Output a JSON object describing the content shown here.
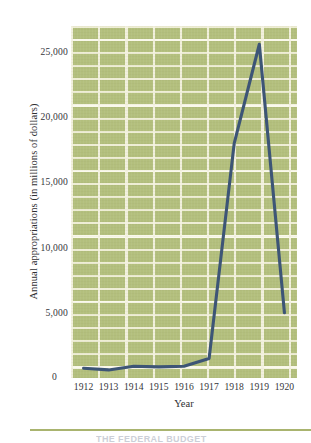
{
  "chart_data": {
    "type": "line",
    "title": "",
    "xlabel": "Year",
    "ylabel": "Annual appropriations (in millions of dollars)",
    "categories": [
      "1912",
      "1913",
      "1914",
      "1915",
      "1916",
      "1917",
      "1918",
      "1919",
      "1920"
    ],
    "x": [
      1912,
      1913,
      1914,
      1915,
      1916,
      1917,
      1918,
      1919,
      1920
    ],
    "values": [
      750,
      620,
      900,
      850,
      900,
      1500,
      18000,
      25600,
      5000
    ],
    "series": [
      {
        "name": "Annual appropriations",
        "values": [
          750,
          620,
          900,
          850,
          900,
          1500,
          18000,
          25600,
          5000
        ]
      }
    ],
    "ylim": [
      0,
      27000
    ],
    "yticks": [
      0,
      5000,
      10000,
      15000,
      20000,
      25000
    ],
    "ytick_labels": [
      "0",
      "5,000",
      "10,000",
      "15,000",
      "20,000",
      "25,000"
    ],
    "grid": true,
    "legend": "none",
    "line_color": "#3d5576",
    "plot_background": "#b3bf7d",
    "gridline_color": "#f3f1dc"
  },
  "axes": {
    "y_title": "Annual appropriations (in millions of dollars)",
    "x_title": "Year",
    "zero_label": "0",
    "y_ticks": [
      {
        "label": "25,000",
        "value": 25000
      },
      {
        "label": "20,000",
        "value": 20000
      },
      {
        "label": "15,000",
        "value": 15000
      },
      {
        "label": "10,000",
        "value": 10000
      },
      {
        "label": "5,000",
        "value": 5000
      }
    ],
    "x_ticks": [
      {
        "label": "1912",
        "value": 1912
      },
      {
        "label": "1913",
        "value": 1913
      },
      {
        "label": "1914",
        "value": 1914
      },
      {
        "label": "1915",
        "value": 1915
      },
      {
        "label": "1916",
        "value": 1916
      },
      {
        "label": "1917",
        "value": 1917
      },
      {
        "label": "1918",
        "value": 1918
      },
      {
        "label": "1919",
        "value": 1919
      },
      {
        "label": "1920",
        "value": 1920
      }
    ]
  },
  "footer": {
    "caption_fragment": "THE FEDERAL BUDGET"
  }
}
